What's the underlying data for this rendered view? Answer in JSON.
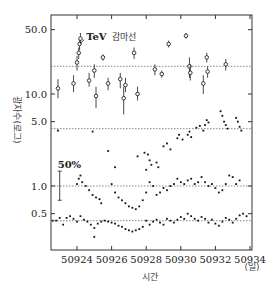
{
  "chart_data": {
    "type": "scatter",
    "title": "",
    "xlabel": "시간",
    "xunit": "(일)",
    "ylabel": "광자수(로그)",
    "yscale": "log",
    "xlim": [
      50922.5,
      50934
    ],
    "ylim": [
      0.2,
      70
    ],
    "x_ticks": [
      50924,
      50926,
      50928,
      50930,
      50932,
      50934
    ],
    "y_ticks": [
      {
        "value": 50.0,
        "label": "50.0"
      },
      {
        "value": 10.0,
        "label": "10.0"
      },
      {
        "value": 5.0,
        "label": "5.0"
      },
      {
        "value": 1.0,
        "label": "1.0"
      },
      {
        "value": 0.5,
        "label": "0.5"
      }
    ],
    "reference_lines": [
      20.0,
      4.2,
      1.0,
      0.42
    ],
    "grid": false,
    "legend": null,
    "annotations": [
      {
        "text": "TeV",
        "text_ko": "감마선",
        "x": 50924.3,
        "y": 40,
        "arrow_to": [
          50924.0,
          38
        ]
      },
      {
        "text": "50%",
        "x": 50923.0,
        "y": 1.0,
        "bar_low": 0.7,
        "bar_high": 1.45
      }
    ],
    "series": [
      {
        "name": "TeV gamma-rays",
        "marker": "circle-errorbar",
        "points": [
          {
            "x": 50922.9,
            "y": 11.5,
            "lo": 9.0,
            "hi": 14.5
          },
          {
            "x": 50923.8,
            "y": 13.0,
            "lo": 10.5,
            "hi": 16.0
          },
          {
            "x": 50924.0,
            "y": 22.0,
            "lo": 18.0,
            "hi": 26.0
          },
          {
            "x": 50924.1,
            "y": 28.0,
            "lo": 24.0,
            "hi": 32.0
          },
          {
            "x": 50924.15,
            "y": 35.0,
            "lo": 30.0,
            "hi": 40.0
          },
          {
            "x": 50924.2,
            "y": 40.0,
            "lo": 35.0,
            "hi": 46.0
          },
          {
            "x": 50924.7,
            "y": 14.0,
            "lo": 12.0,
            "hi": 17.0
          },
          {
            "x": 50925.0,
            "y": 18.0,
            "lo": 15.0,
            "hi": 21.0
          },
          {
            "x": 50925.1,
            "y": 9.5,
            "lo": 7.0,
            "hi": 12.0
          },
          {
            "x": 50925.5,
            "y": 25.0,
            "lo": 23.0,
            "hi": 27.0
          },
          {
            "x": 50925.8,
            "y": 13.0,
            "lo": 11.0,
            "hi": 15.0
          },
          {
            "x": 50926.5,
            "y": 14.5,
            "lo": 11.5,
            "hi": 17.0
          },
          {
            "x": 50926.7,
            "y": 9.0,
            "lo": 6.0,
            "hi": 12.0
          },
          {
            "x": 50926.8,
            "y": 12.5,
            "lo": 10.5,
            "hi": 15.0
          },
          {
            "x": 50927.3,
            "y": 28.0,
            "lo": 24.0,
            "hi": 32.0
          },
          {
            "x": 50927.5,
            "y": 10.0,
            "lo": 8.5,
            "hi": 12.0
          },
          {
            "x": 50928.5,
            "y": 18.5,
            "lo": 16.0,
            "hi": 21.0
          },
          {
            "x": 50928.9,
            "y": 16.5,
            "lo": 15.0,
            "hi": 18.0
          },
          {
            "x": 50929.3,
            "y": 35.0,
            "lo": 32.0,
            "hi": 38.0
          },
          {
            "x": 50930.3,
            "y": 43.0,
            "lo": 40.0,
            "hi": 46.0
          },
          {
            "x": 50930.5,
            "y": 20.0,
            "lo": 15.0,
            "hi": 25.0
          },
          {
            "x": 50930.55,
            "y": 17.0,
            "lo": 14.0,
            "hi": 21.0
          },
          {
            "x": 50931.3,
            "y": 13.0,
            "lo": 10.0,
            "hi": 16.0
          },
          {
            "x": 50931.5,
            "y": 25.0,
            "lo": 22.0,
            "hi": 28.0
          },
          {
            "x": 50931.55,
            "y": 17.5,
            "lo": 15.0,
            "hi": 20.0
          },
          {
            "x": 50932.6,
            "y": 21.0,
            "lo": 18.0,
            "hi": 24.0
          }
        ]
      },
      {
        "name": "X-ray 2-10 keV (upper)",
        "marker": "dot",
        "points": [
          {
            "x": 50922.9,
            "y": 4.0
          },
          {
            "x": 50924.9,
            "y": 3.9
          },
          {
            "x": 50925.8,
            "y": 2.4
          },
          {
            "x": 50926.2,
            "y": 1.6
          },
          {
            "x": 50927.5,
            "y": 2.1
          },
          {
            "x": 50927.9,
            "y": 2.3
          },
          {
            "x": 50928.0,
            "y": 1.5
          },
          {
            "x": 50928.1,
            "y": 2.2
          },
          {
            "x": 50928.2,
            "y": 1.9
          },
          {
            "x": 50928.3,
            "y": 1.7
          },
          {
            "x": 50928.6,
            "y": 1.8
          },
          {
            "x": 50928.7,
            "y": 1.6
          },
          {
            "x": 50929.0,
            "y": 2.7
          },
          {
            "x": 50929.2,
            "y": 2.9
          },
          {
            "x": 50929.4,
            "y": 2.5
          },
          {
            "x": 50929.8,
            "y": 3.3
          },
          {
            "x": 50929.9,
            "y": 3.6
          },
          {
            "x": 50930.1,
            "y": 3.2
          },
          {
            "x": 50930.4,
            "y": 3.6
          },
          {
            "x": 50930.5,
            "y": 3.9
          },
          {
            "x": 50930.6,
            "y": 3.4
          },
          {
            "x": 50930.9,
            "y": 4.3
          },
          {
            "x": 50931.1,
            "y": 4.5
          },
          {
            "x": 50931.3,
            "y": 4.0
          },
          {
            "x": 50931.4,
            "y": 4.6
          },
          {
            "x": 50931.5,
            "y": 5.2
          },
          {
            "x": 50931.6,
            "y": 4.9
          },
          {
            "x": 50932.3,
            "y": 6.5
          },
          {
            "x": 50932.4,
            "y": 5.8
          },
          {
            "x": 50932.5,
            "y": 5.0
          },
          {
            "x": 50932.6,
            "y": 4.6
          },
          {
            "x": 50932.7,
            "y": 4.2
          },
          {
            "x": 50933.2,
            "y": 5.5
          },
          {
            "x": 50933.3,
            "y": 5.0
          },
          {
            "x": 50933.4,
            "y": 4.4
          },
          {
            "x": 50933.5,
            "y": 4.0
          }
        ]
      },
      {
        "name": "X-ray (middle)",
        "marker": "dot",
        "points": [
          {
            "x": 50924.0,
            "y": 1.05
          },
          {
            "x": 50924.1,
            "y": 1.2
          },
          {
            "x": 50924.2,
            "y": 1.3
          },
          {
            "x": 50924.3,
            "y": 1.1
          },
          {
            "x": 50924.5,
            "y": 1.0
          },
          {
            "x": 50924.7,
            "y": 0.9
          },
          {
            "x": 50924.9,
            "y": 0.8
          },
          {
            "x": 50925.1,
            "y": 0.75
          },
          {
            "x": 50925.3,
            "y": 0.72
          },
          {
            "x": 50925.4,
            "y": 0.65
          },
          {
            "x": 50926.0,
            "y": 1.05
          },
          {
            "x": 50926.2,
            "y": 0.85
          },
          {
            "x": 50926.4,
            "y": 0.75
          },
          {
            "x": 50926.6,
            "y": 0.7
          },
          {
            "x": 50926.8,
            "y": 0.65
          },
          {
            "x": 50927.0,
            "y": 0.6
          },
          {
            "x": 50927.2,
            "y": 0.58
          },
          {
            "x": 50927.4,
            "y": 0.56
          },
          {
            "x": 50927.6,
            "y": 0.6
          },
          {
            "x": 50927.8,
            "y": 0.7
          },
          {
            "x": 50928.0,
            "y": 0.85
          },
          {
            "x": 50928.2,
            "y": 1.1
          },
          {
            "x": 50928.4,
            "y": 1.0
          },
          {
            "x": 50928.6,
            "y": 0.8
          },
          {
            "x": 50928.8,
            "y": 0.85
          },
          {
            "x": 50929.0,
            "y": 0.95
          },
          {
            "x": 50929.2,
            "y": 0.9
          },
          {
            "x": 50929.4,
            "y": 1.0
          },
          {
            "x": 50929.6,
            "y": 1.05
          },
          {
            "x": 50929.8,
            "y": 1.2
          },
          {
            "x": 50930.0,
            "y": 1.1
          },
          {
            "x": 50930.2,
            "y": 1.05
          },
          {
            "x": 50930.4,
            "y": 1.15
          },
          {
            "x": 50930.6,
            "y": 1.2
          },
          {
            "x": 50930.8,
            "y": 1.05
          },
          {
            "x": 50931.0,
            "y": 1.1
          },
          {
            "x": 50931.2,
            "y": 1.25
          },
          {
            "x": 50931.4,
            "y": 1.1
          },
          {
            "x": 50931.6,
            "y": 1.0
          },
          {
            "x": 50931.8,
            "y": 1.05
          },
          {
            "x": 50932.0,
            "y": 0.95
          },
          {
            "x": 50932.2,
            "y": 0.85
          },
          {
            "x": 50932.4,
            "y": 0.9
          },
          {
            "x": 50932.6,
            "y": 1.05
          },
          {
            "x": 50932.8,
            "y": 1.3
          },
          {
            "x": 50933.0,
            "y": 1.25
          },
          {
            "x": 50933.2,
            "y": 1.05
          },
          {
            "x": 50933.4,
            "y": 1.15
          }
        ]
      },
      {
        "name": "X-ray (lower)",
        "marker": "dot",
        "points": [
          {
            "x": 50922.6,
            "y": 0.42
          },
          {
            "x": 50922.8,
            "y": 0.42
          },
          {
            "x": 50923.0,
            "y": 0.45
          },
          {
            "x": 50923.2,
            "y": 0.38
          },
          {
            "x": 50923.4,
            "y": 0.45
          },
          {
            "x": 50923.6,
            "y": 0.47
          },
          {
            "x": 50923.8,
            "y": 0.44
          },
          {
            "x": 50924.0,
            "y": 0.41
          },
          {
            "x": 50924.2,
            "y": 0.47
          },
          {
            "x": 50924.4,
            "y": 0.43
          },
          {
            "x": 50924.6,
            "y": 0.41
          },
          {
            "x": 50924.8,
            "y": 0.38
          },
          {
            "x": 50925.0,
            "y": 0.35
          },
          {
            "x": 50925.2,
            "y": 0.39
          },
          {
            "x": 50925.4,
            "y": 0.41
          },
          {
            "x": 50925.6,
            "y": 0.42
          },
          {
            "x": 50925.8,
            "y": 0.41
          },
          {
            "x": 50926.0,
            "y": 0.4
          },
          {
            "x": 50926.2,
            "y": 0.39
          },
          {
            "x": 50926.4,
            "y": 0.37
          },
          {
            "x": 50926.6,
            "y": 0.36
          },
          {
            "x": 50926.8,
            "y": 0.34
          },
          {
            "x": 50927.0,
            "y": 0.33
          },
          {
            "x": 50927.2,
            "y": 0.32
          },
          {
            "x": 50927.4,
            "y": 0.33
          },
          {
            "x": 50927.6,
            "y": 0.34
          },
          {
            "x": 50927.8,
            "y": 0.36
          },
          {
            "x": 50928.0,
            "y": 0.42
          },
          {
            "x": 50928.2,
            "y": 0.38
          },
          {
            "x": 50928.4,
            "y": 0.41
          },
          {
            "x": 50928.6,
            "y": 0.43
          },
          {
            "x": 50928.8,
            "y": 0.4
          },
          {
            "x": 50929.0,
            "y": 0.38
          },
          {
            "x": 50929.2,
            "y": 0.44
          },
          {
            "x": 50929.4,
            "y": 0.42
          },
          {
            "x": 50929.6,
            "y": 0.4
          },
          {
            "x": 50929.8,
            "y": 0.43
          },
          {
            "x": 50930.0,
            "y": 0.46
          },
          {
            "x": 50930.2,
            "y": 0.44
          },
          {
            "x": 50930.4,
            "y": 0.5
          },
          {
            "x": 50930.6,
            "y": 0.47
          },
          {
            "x": 50930.8,
            "y": 0.44
          },
          {
            "x": 50931.0,
            "y": 0.42
          },
          {
            "x": 50931.2,
            "y": 0.46
          },
          {
            "x": 50931.4,
            "y": 0.44
          },
          {
            "x": 50931.6,
            "y": 0.4
          },
          {
            "x": 50931.8,
            "y": 0.43
          },
          {
            "x": 50932.0,
            "y": 0.39
          },
          {
            "x": 50932.2,
            "y": 0.37
          },
          {
            "x": 50932.4,
            "y": 0.41
          },
          {
            "x": 50932.6,
            "y": 0.45
          },
          {
            "x": 50932.8,
            "y": 0.43
          },
          {
            "x": 50933.0,
            "y": 0.4
          },
          {
            "x": 50933.2,
            "y": 0.44
          },
          {
            "x": 50933.4,
            "y": 0.48
          },
          {
            "x": 50933.6,
            "y": 0.5
          },
          {
            "x": 50933.8,
            "y": 0.47
          },
          {
            "x": 50925.0,
            "y": 0.28
          }
        ]
      }
    ]
  }
}
